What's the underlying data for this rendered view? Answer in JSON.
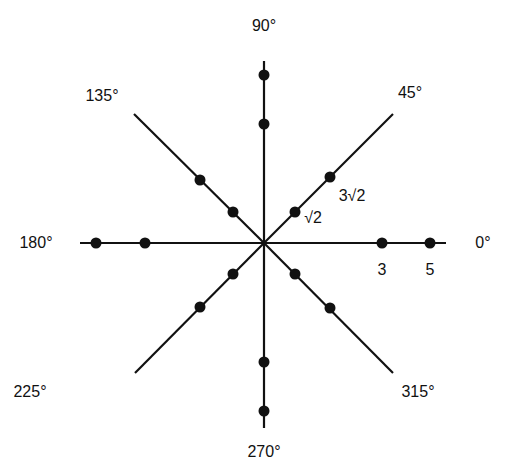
{
  "diagram": {
    "title": "",
    "center": [
      264,
      243
    ],
    "colors": {
      "line": "#111111",
      "dot": "#111111",
      "background": "#ffffff"
    },
    "rays": [
      {
        "angle_label": "0°",
        "end": [
          446,
          243
        ],
        "label_pos": [
          483,
          243
        ],
        "dots": [
          [
            382,
            243
          ],
          [
            430,
            243
          ]
        ]
      },
      {
        "angle_label": "45°",
        "end": [
          393,
          114
        ],
        "label_pos": [
          410,
          93
        ],
        "dots": [
          [
            295,
            212
          ],
          [
            330,
            177
          ]
        ]
      },
      {
        "angle_label": "90°",
        "end": [
          264,
          61
        ],
        "label_pos": [
          264,
          26
        ],
        "dots": [
          [
            264,
            124
          ],
          [
            264,
            75
          ]
        ]
      },
      {
        "angle_label": "135°",
        "end": [
          134,
          114
        ],
        "label_pos": [
          102,
          96
        ],
        "dots": [
          [
            233,
            212
          ],
          [
            200,
            180
          ]
        ]
      },
      {
        "angle_label": "180°",
        "end": [
          80,
          243
        ],
        "label_pos": [
          36,
          243
        ],
        "dots": [
          [
            145,
            243
          ],
          [
            96,
            243
          ]
        ]
      },
      {
        "angle_label": "225°",
        "end": [
          135,
          373
        ],
        "label_pos": [
          30,
          392
        ],
        "dots": [
          [
            233,
            274
          ],
          [
            200,
            307
          ]
        ]
      },
      {
        "angle_label": "270°",
        "end": [
          264,
          428
        ],
        "label_pos": [
          264,
          452
        ],
        "dots": [
          [
            264,
            362
          ],
          [
            264,
            411
          ]
        ]
      },
      {
        "angle_label": "315°",
        "end": [
          393,
          373
        ],
        "label_pos": [
          418,
          392
        ],
        "dots": [
          [
            295,
            274
          ],
          [
            330,
            308
          ]
        ]
      }
    ],
    "value_labels": [
      {
        "text": "3",
        "pos": [
          382,
          270
        ]
      },
      {
        "text": "5",
        "pos": [
          430,
          270
        ]
      },
      {
        "text": "√2",
        "pos": [
          313,
          218
        ]
      },
      {
        "text": "3√2",
        "pos": [
          352,
          196
        ]
      }
    ]
  }
}
